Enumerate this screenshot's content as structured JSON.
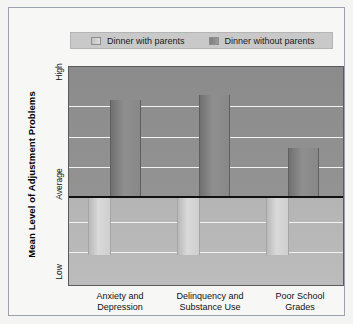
{
  "figure": {
    "background_color": "#f7f7f5",
    "frame_color": "#9aa3ad"
  },
  "legend": {
    "position": "top-center",
    "background_color": "#c9c9c9",
    "entries": [
      {
        "label": "Dinner with parents",
        "swatch": "light-gray",
        "color": "#d0d0d0"
      },
      {
        "label": "Dinner without parents",
        "swatch": "dark-gray",
        "color": "#8a8a8a"
      }
    ]
  },
  "axes": {
    "y_title": "Mean Level of Adjustment Problems",
    "y_ticks": [
      "High",
      "Average",
      "Low"
    ],
    "x_ticks": [
      "Anxiety and\nDepression",
      "Delinquency and\nSubstance Use",
      "Poor School\nGrades"
    ]
  },
  "chart_data": {
    "type": "bar",
    "title": "",
    "subtitle": "",
    "xlabel": "",
    "ylabel": "Mean Level of Adjustment Problems",
    "categories": [
      "Anxiety and Depression",
      "Delinquency and Substance Use",
      "Poor School Grades"
    ],
    "category_lines": [
      [
        "Anxiety and",
        "Depression"
      ],
      [
        "Delinquency and",
        "Substance Use"
      ],
      [
        "Poor School",
        "Grades"
      ]
    ],
    "baseline_label": "Average",
    "ylim": [
      0,
      100
    ],
    "y_tick_labels": [
      "High",
      "Average",
      "Low"
    ],
    "y_tick_positions": [
      100,
      41,
      0
    ],
    "grid": true,
    "gridline_color": "#f2f2f2",
    "gridline_positions_pct": [
      18,
      32,
      46,
      59.1,
      71,
      85
    ],
    "baseline_pct": 41,
    "legend_position": "top-center",
    "series": [
      {
        "name": "Dinner with parents",
        "color": "#d0d0d0",
        "direction": "below-average",
        "values": [
          -27,
          -27,
          -27
        ],
        "note": "bars extend downward from the Average baseline toward Low"
      },
      {
        "name": "Dinner without parents",
        "color": "#8a8a8a",
        "direction": "above-average",
        "values": [
          44,
          46,
          22
        ],
        "note": "bars extend upward from the Average baseline toward High"
      }
    ]
  },
  "bars": [
    {
      "group": 0,
      "series": "Dinner with parents",
      "x_pct": 6.9,
      "w_pct": 8.3,
      "top_pct": 59.1,
      "h_pct": 27.3
    },
    {
      "group": 0,
      "series": "Dinner without parents",
      "x_pct": 14.9,
      "w_pct": 11.2,
      "top_pct": 15.0,
      "h_pct": 44.1
    },
    {
      "group": 1,
      "series": "Dinner with parents",
      "x_pct": 39.5,
      "w_pct": 8.3,
      "top_pct": 59.1,
      "h_pct": 27.3
    },
    {
      "group": 1,
      "series": "Dinner without parents",
      "x_pct": 47.5,
      "w_pct": 11.2,
      "top_pct": 13.0,
      "h_pct": 46.1
    },
    {
      "group": 2,
      "series": "Dinner with parents",
      "x_pct": 72.0,
      "w_pct": 8.3,
      "top_pct": 59.1,
      "h_pct": 27.3
    },
    {
      "group": 2,
      "series": "Dinner without parents",
      "x_pct": 80.0,
      "w_pct": 11.2,
      "top_pct": 37.0,
      "h_pct": 22.1
    }
  ]
}
